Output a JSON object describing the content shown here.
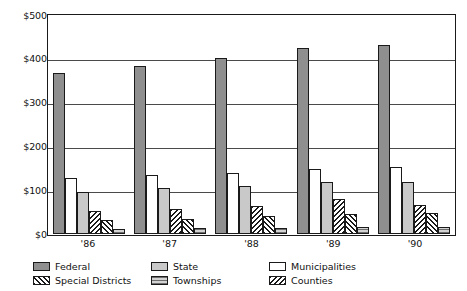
{
  "chart_data": {
    "type": "bar",
    "title": "",
    "xlabel": "",
    "ylabel": "",
    "categories": [
      "'86",
      "'87",
      "'88",
      "'89",
      "'90"
    ],
    "ylim": [
      0,
      500
    ],
    "ytick_labels": [
      "$500",
      "$400",
      "$300",
      "$200",
      "$100",
      "$0"
    ],
    "ytick_values": [
      500,
      400,
      300,
      200,
      100,
      0
    ],
    "grid": true,
    "legend_position": "bottom",
    "series": [
      {
        "name": "Federal",
        "values": [
          367,
          383,
          401,
          423,
          431
        ]
      },
      {
        "name": "Municipalities",
        "values": [
          127,
          133,
          138,
          147,
          153
        ]
      },
      {
        "name": "State",
        "values": [
          95,
          103,
          109,
          118,
          117
        ]
      },
      {
        "name": "Counties",
        "values": [
          52,
          57,
          63,
          78,
          66
        ]
      },
      {
        "name": "Special Districts",
        "values": [
          30,
          34,
          39,
          44,
          47
        ]
      },
      {
        "name": "Townships",
        "values": [
          10,
          12,
          13,
          14,
          14
        ]
      }
    ]
  },
  "axis": {
    "y_labels": [
      "$500",
      "$400",
      "$300",
      "$200",
      "$100",
      "$0"
    ],
    "x_labels": [
      "'86",
      "'87",
      "'88",
      "'89",
      "'90"
    ]
  },
  "legend": {
    "items": [
      {
        "label": "Federal",
        "style": "f-federal"
      },
      {
        "label": "Special Districts",
        "style": "f-special"
      },
      {
        "label": "State",
        "style": "f-state"
      },
      {
        "label": "Townships",
        "style": "f-townships"
      },
      {
        "label": "Municipalities",
        "style": "f-municipalities"
      },
      {
        "label": "Counties",
        "style": "f-counties"
      }
    ]
  },
  "colors": {
    "federal": "#8f8f8f",
    "state": "#c9c9c9",
    "municipalities": "#ffffff",
    "townships": "#b5b5b5",
    "outline": "#1a1a1a",
    "gridline": "#4a4a4a"
  }
}
